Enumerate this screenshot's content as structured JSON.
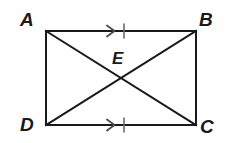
{
  "figure": {
    "type": "geometry-diagram",
    "background_color": "#ffffff",
    "stroke_color": "#1a1a1a",
    "stroke_width": 2,
    "canvas": {
      "width": 229,
      "height": 143
    },
    "vertices": [
      {
        "id": "A",
        "label": "A",
        "x": 46,
        "y": 31,
        "label_x": 20,
        "label_y": 10
      },
      {
        "id": "B",
        "label": "B",
        "x": 196,
        "y": 31,
        "label_x": 199,
        "label_y": 10
      },
      {
        "id": "C",
        "label": "C",
        "x": 196,
        "y": 125,
        "label_x": 200,
        "label_y": 117
      },
      {
        "id": "D",
        "label": "D",
        "x": 46,
        "y": 125,
        "label_x": 20,
        "label_y": 115
      }
    ],
    "interior_points": [
      {
        "id": "E",
        "label": "E",
        "x": 121,
        "y": 78,
        "label_x": 112,
        "label_y": 50
      }
    ],
    "sides": [
      {
        "id": "AB",
        "from": "A",
        "to": "B"
      },
      {
        "id": "BC",
        "from": "B",
        "to": "C"
      },
      {
        "id": "CD",
        "from": "C",
        "to": "D"
      },
      {
        "id": "DA",
        "from": "D",
        "to": "A"
      }
    ],
    "diagonals": [
      {
        "id": "AC",
        "from": "A",
        "to": "C"
      },
      {
        "id": "BD",
        "from": "B",
        "to": "D"
      }
    ],
    "markers": [
      {
        "id": "marker-AB",
        "on_side": "AB",
        "kind": "parallel-arrow-plus-congruence-tick",
        "arrow_x": 112,
        "arrow_y": 31,
        "tick_x": 124,
        "tick_y": 31
      },
      {
        "id": "marker-DC",
        "on_side": "CD",
        "kind": "parallel-arrow-plus-congruence-tick",
        "arrow_x": 112,
        "arrow_y": 125,
        "tick_x": 124,
        "tick_y": 125
      }
    ]
  }
}
